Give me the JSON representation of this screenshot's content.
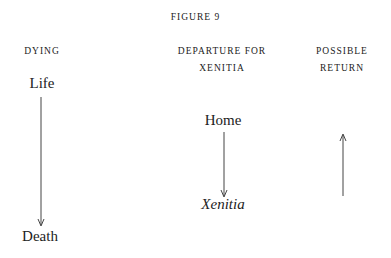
{
  "figure": {
    "title": "FIGURE 9"
  },
  "columns": [
    {
      "heading_lines": [
        "DYING"
      ],
      "from": "Life",
      "to": "Death",
      "arrow": "down"
    },
    {
      "heading_lines": [
        "DEPARTURE FOR",
        "XENITIA"
      ],
      "from": "Home",
      "to": "Xenitia",
      "arrow": "down"
    },
    {
      "heading_lines": [
        "POSSIBLE",
        "RETURN"
      ],
      "from": "",
      "to": "",
      "arrow": "up"
    }
  ],
  "colors": {
    "text": "#222222",
    "arrow": "#444444",
    "background": "#ffffff"
  }
}
